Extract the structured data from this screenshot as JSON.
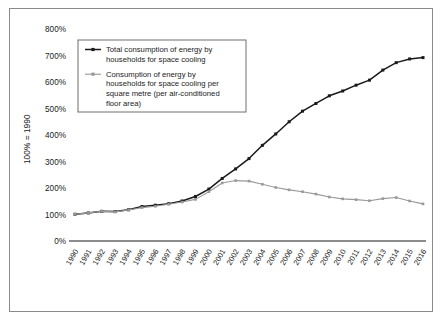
{
  "chart_data": {
    "type": "line",
    "title": "",
    "xlabel": "",
    "ylabel": "100% = 1990",
    "ylim": [
      0,
      800
    ],
    "yticks": [
      "0%",
      "100%",
      "200%",
      "300%",
      "400%",
      "500%",
      "600%",
      "700%",
      "800%"
    ],
    "ytick_values": [
      0,
      100,
      200,
      300,
      400,
      500,
      600,
      700,
      800
    ],
    "grid": false,
    "legend_position": "upper-left-inside",
    "x": [
      "1990",
      "1991",
      "1992",
      "1993",
      "1994",
      "1995",
      "1996",
      "1997",
      "1998",
      "1999",
      "2000",
      "2001",
      "2002",
      "2003",
      "2004",
      "2005",
      "2006",
      "2007",
      "2008",
      "2009",
      "2010",
      "2011",
      "2012",
      "2013",
      "2014",
      "2015",
      "2016"
    ],
    "categories": [
      "1990",
      "1991",
      "1992",
      "1993",
      "1994",
      "1995",
      "1996",
      "1997",
      "1998",
      "1999",
      "2000",
      "2001",
      "2002",
      "2003",
      "2004",
      "2005",
      "2006",
      "2007",
      "2008",
      "2009",
      "2010",
      "2011",
      "2012",
      "2013",
      "2014",
      "2015",
      "2016"
    ],
    "series": [
      {
        "name": "Total consumption of energy by households for space cooling",
        "color": "#1a1a1a",
        "marker": "square",
        "values": [
          101,
          106,
          112,
          111,
          118,
          130,
          135,
          141,
          151,
          168,
          196,
          236,
          272,
          311,
          361,
          404,
          450,
          490,
          519,
          548,
          566,
          588,
          607,
          645,
          673,
          687,
          692
        ]
      },
      {
        "name": "Consumption of energy by households for space cooling per square metre (per air-conditioned floor area)",
        "color": "#999999",
        "marker": "square",
        "values": [
          101,
          106,
          112,
          110,
          117,
          126,
          131,
          139,
          147,
          157,
          186,
          219,
          228,
          226,
          214,
          202,
          193,
          186,
          177,
          166,
          159,
          156,
          152,
          160,
          164,
          151,
          140
        ]
      }
    ]
  },
  "legend": {
    "entries": [
      {
        "label_lines": [
          "Total consumption of energy by",
          "households for space cooling"
        ],
        "color": "#1a1a1a"
      },
      {
        "label_lines": [
          "Consumption of energy by",
          "households for space cooling per",
          "square metre (per air-conditioned",
          "floor area)"
        ],
        "color": "#999999"
      }
    ]
  },
  "colors": {
    "series_total": "#1a1a1a",
    "series_per_sqm": "#999999",
    "axis": "#1a1a1a",
    "frame": "#8a8a8a",
    "background": "#ffffff"
  }
}
